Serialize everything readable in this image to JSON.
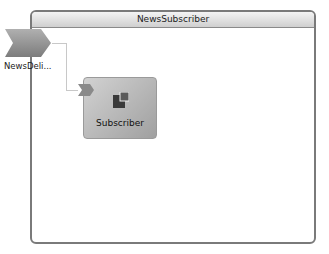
{
  "container": {
    "title": "NewsSubscriber"
  },
  "external_port": {
    "label": "NewsDeli..."
  },
  "component": {
    "label": "Subscriber",
    "icon": "component-icon"
  },
  "colors": {
    "border": "#7a7a7a",
    "header_top": "#f4f4f4",
    "header_bottom": "#cfcfcf",
    "component_fill": "#b8b8b8",
    "connector": "#c8c8c8"
  }
}
